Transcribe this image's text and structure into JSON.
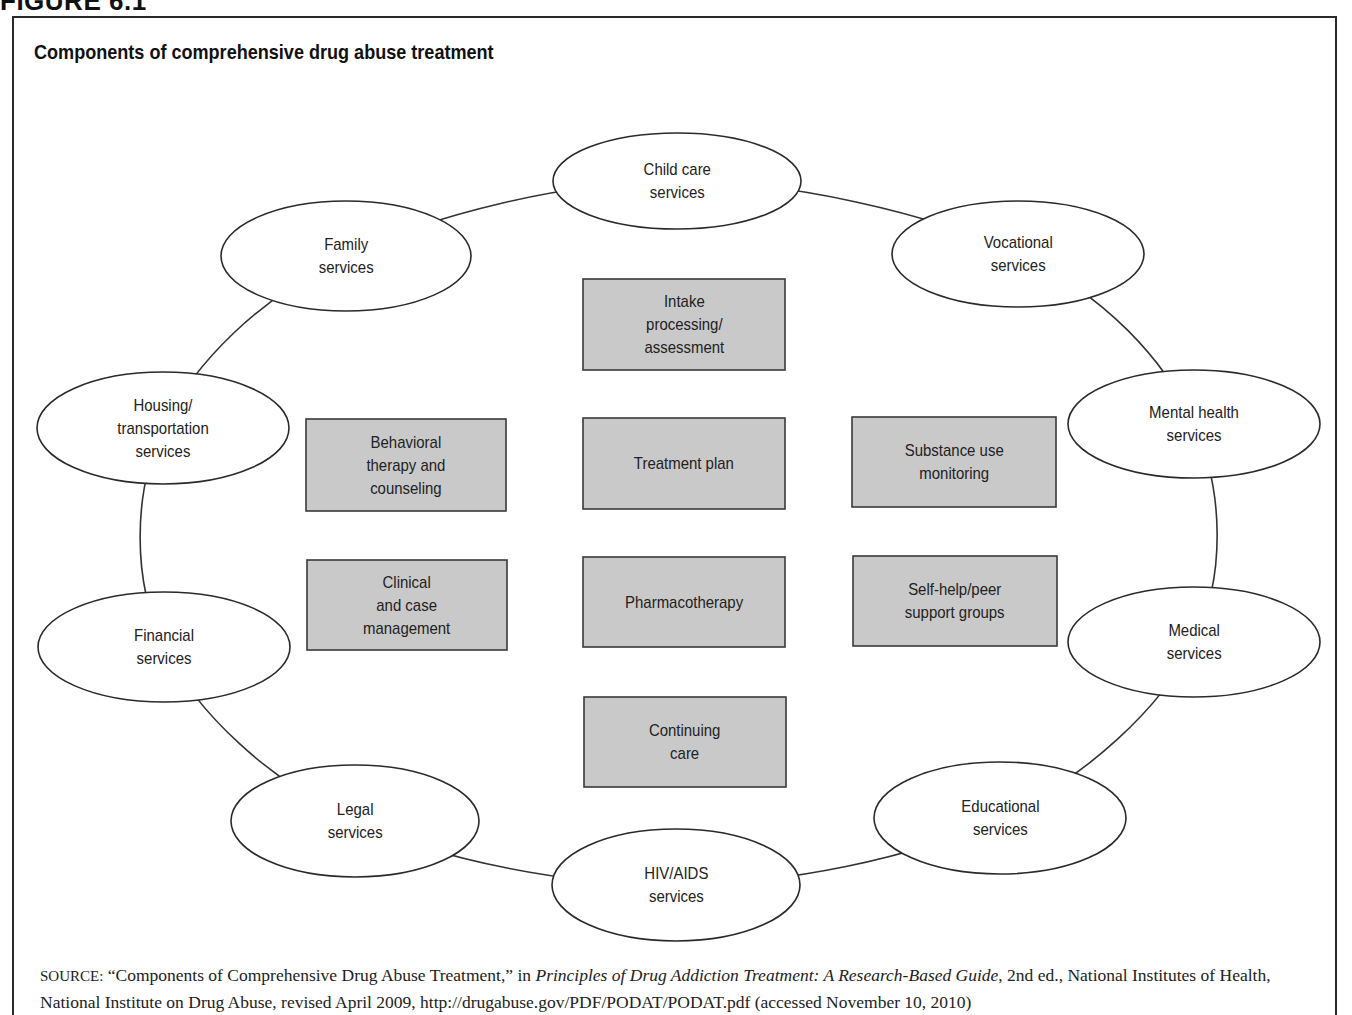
{
  "figure_label": "FIGURE 6.1",
  "title": "Components of comprehensive drug abuse treatment",
  "colors": {
    "box_fill": "#c9c9c9",
    "box_border": "#3a3a3a",
    "ellipse_border": "#2a2a2a",
    "ring_line": "#333333",
    "background": "#ffffff"
  },
  "core_components": [
    {
      "id": "intake",
      "label": "Intake\nprocessing/\nassessment",
      "x": 583,
      "y": 279,
      "w": 202,
      "h": 91
    },
    {
      "id": "behavioral",
      "label": "Behavioral\ntherapy and\ncounseling",
      "x": 306,
      "y": 419,
      "w": 200,
      "h": 92
    },
    {
      "id": "treatment-plan",
      "label": "Treatment plan",
      "x": 583,
      "y": 418,
      "w": 202,
      "h": 91
    },
    {
      "id": "substance-monitoring",
      "label": "Substance use\nmonitoring",
      "x": 852,
      "y": 417,
      "w": 204,
      "h": 90
    },
    {
      "id": "clinical",
      "label": "Clinical\nand case\nmanagement",
      "x": 307,
      "y": 560,
      "w": 200,
      "h": 90
    },
    {
      "id": "pharmacotherapy",
      "label": "Pharmacotherapy",
      "x": 583,
      "y": 557,
      "w": 202,
      "h": 90
    },
    {
      "id": "self-help",
      "label": "Self-help/peer\nsupport groups",
      "x": 853,
      "y": 556,
      "w": 204,
      "h": 90
    },
    {
      "id": "continuing-care",
      "label": "Continuing\ncare",
      "x": 584,
      "y": 697,
      "w": 202,
      "h": 90
    }
  ],
  "wraparound_services": [
    {
      "id": "child-care",
      "label": "Child care\nservices",
      "cx": 677,
      "cy": 181,
      "rx": 124,
      "ry": 48
    },
    {
      "id": "vocational",
      "label": "Vocational\nservices",
      "cx": 1018,
      "cy": 254,
      "rx": 126,
      "ry": 53
    },
    {
      "id": "mental-health",
      "label": "Mental health\nservices",
      "cx": 1194,
      "cy": 424,
      "rx": 126,
      "ry": 54
    },
    {
      "id": "medical",
      "label": "Medical\nservices",
      "cx": 1194,
      "cy": 642,
      "rx": 126,
      "ry": 55
    },
    {
      "id": "educational",
      "label": "Educational\nservices",
      "cx": 1000,
      "cy": 818,
      "rx": 126,
      "ry": 56
    },
    {
      "id": "hiv-aids",
      "label": "HIV/AIDS\nservices",
      "cx": 676,
      "cy": 885,
      "rx": 124,
      "ry": 56
    },
    {
      "id": "legal",
      "label": "Legal\nservices",
      "cx": 355,
      "cy": 821,
      "rx": 124,
      "ry": 56
    },
    {
      "id": "financial",
      "label": "Financial\nservices",
      "cx": 164,
      "cy": 647,
      "rx": 126,
      "ry": 55
    },
    {
      "id": "housing",
      "label": "Housing/\ntransportation\nservices",
      "cx": 163,
      "cy": 428,
      "rx": 126,
      "ry": 56
    },
    {
      "id": "family",
      "label": "Family\nservices",
      "cx": 346,
      "cy": 256,
      "rx": 125,
      "ry": 55
    }
  ],
  "source": {
    "prefix": "SOURCE:",
    "quote": "“Components of Comprehensive Drug Abuse Treatment,” in ",
    "book": "Principles of Drug Addiction Treatment: A Research-Based Guide",
    "rest": ", 2nd ed., National Institutes of Health, National Institute on Drug Abuse, revised April 2009, http://drugabuse.gov/PDF/PODAT/PODAT.pdf (accessed November 10, 2010)"
  }
}
